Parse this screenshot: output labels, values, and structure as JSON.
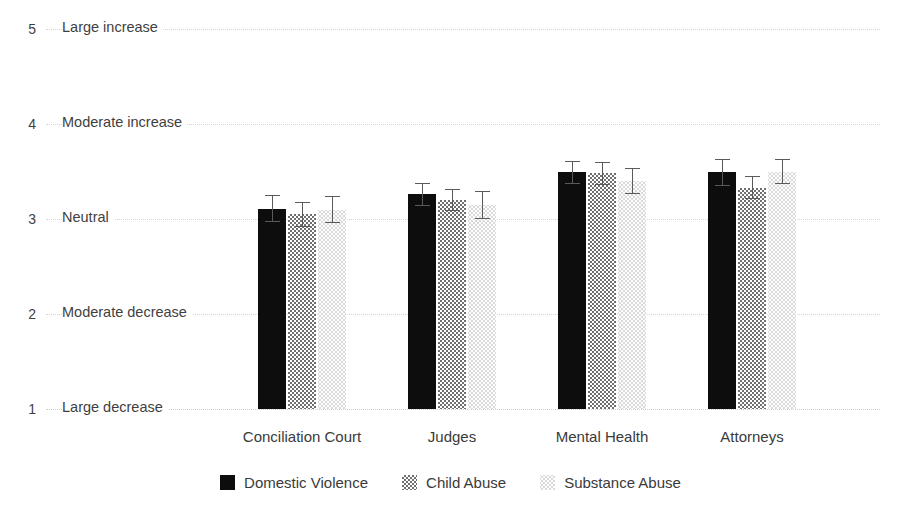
{
  "chart_data": {
    "type": "bar",
    "title": "",
    "xlabel": "",
    "ylabel": "",
    "ylim": [
      1,
      5
    ],
    "grid": true,
    "legend_position": "bottom",
    "orientation": "vertical",
    "error_bars": true,
    "categories": [
      "Conciliation Court",
      "Judges",
      "Mental Health",
      "Attorneys"
    ],
    "y_ticks": [
      {
        "value": 5,
        "number": "5",
        "label": "Large increase"
      },
      {
        "value": 4,
        "number": "4",
        "label": "Moderate increase"
      },
      {
        "value": 3,
        "number": "3",
        "label": "Neutral"
      },
      {
        "value": 2,
        "number": "2",
        "label": "Moderate decrease"
      },
      {
        "value": 1,
        "number": "1",
        "label": "Large decrease"
      }
    ],
    "series": [
      {
        "name": "Domestic Violence",
        "color": "#0d0d0d",
        "pattern": "solid-black",
        "values": [
          3.11,
          3.26,
          3.49,
          3.49
        ],
        "errors": [
          0.14,
          0.12,
          0.12,
          0.14
        ]
      },
      {
        "name": "Child Abuse",
        "color": "#6f6f6f",
        "pattern": "checkerboard-gray",
        "values": [
          3.05,
          3.2,
          3.48,
          3.33
        ],
        "errors": [
          0.13,
          0.12,
          0.12,
          0.12
        ]
      },
      {
        "name": "Substance Abuse",
        "color": "#dadada",
        "pattern": "light-dotted",
        "values": [
          3.1,
          3.15,
          3.4,
          3.5
        ],
        "errors": [
          0.14,
          0.15,
          0.14,
          0.13
        ]
      }
    ]
  },
  "legend": {
    "items": [
      {
        "label": "Domestic Violence",
        "swatch": "legend-swatch-domestic-violence"
      },
      {
        "label": "Child Abuse",
        "swatch": "legend-swatch-child-abuse"
      },
      {
        "label": "Substance Abuse",
        "swatch": "legend-swatch-substance-abuse"
      }
    ]
  }
}
